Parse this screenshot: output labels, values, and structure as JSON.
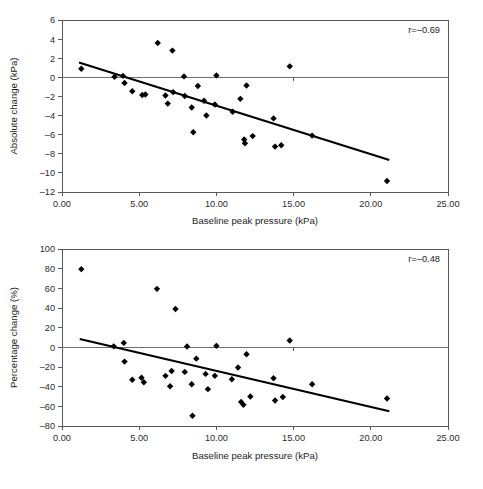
{
  "figure": {
    "background": "#ffffff",
    "marker_color": "#000000",
    "trend_color": "#000000",
    "axis_color": "#55595c"
  },
  "chart_data": [
    {
      "id": "absolute-change",
      "type": "scatter",
      "title": "",
      "xlabel": "Baseline peak pressure (kPa)",
      "ylabel": "Absolute change (kPa)",
      "xlim": [
        0,
        25
      ],
      "ylim": [
        -12,
        6
      ],
      "grid": false,
      "legend": "none",
      "xticks": [
        0,
        5,
        10,
        15,
        20,
        25
      ],
      "xtick_labels": [
        "0.00",
        "5.00",
        "10.00",
        "15.00",
        "20.00",
        "25.00"
      ],
      "yticks": [
        6,
        4,
        2,
        0,
        -2,
        -4,
        -6,
        -8,
        -10,
        -12
      ],
      "ytick_labels": [
        "6",
        "4",
        "2",
        "0",
        "–2",
        "–4",
        "–6",
        "–8",
        "–10",
        "–12"
      ],
      "zero_line": 0,
      "annotation": "r=–0.69",
      "annotation_value": -0.69,
      "trend": {
        "x1": 1.1,
        "y1": 1.55,
        "x2": 21.2,
        "y2": -8.65
      },
      "points": [
        {
          "x": 1.25,
          "y": 0.9
        },
        {
          "x": 3.4,
          "y": 0.05
        },
        {
          "x": 3.95,
          "y": 0.15
        },
        {
          "x": 4.05,
          "y": -0.6
        },
        {
          "x": 4.55,
          "y": -1.45
        },
        {
          "x": 5.2,
          "y": -1.85
        },
        {
          "x": 5.4,
          "y": -1.8
        },
        {
          "x": 6.2,
          "y": 3.6
        },
        {
          "x": 6.7,
          "y": -1.9
        },
        {
          "x": 6.85,
          "y": -2.75
        },
        {
          "x": 7.15,
          "y": 2.8
        },
        {
          "x": 7.2,
          "y": -1.55
        },
        {
          "x": 7.9,
          "y": 0.1
        },
        {
          "x": 7.95,
          "y": -1.95
        },
        {
          "x": 8.4,
          "y": -3.15
        },
        {
          "x": 8.5,
          "y": -5.75
        },
        {
          "x": 8.8,
          "y": -0.9
        },
        {
          "x": 9.2,
          "y": -2.45
        },
        {
          "x": 9.35,
          "y": -4.0
        },
        {
          "x": 9.9,
          "y": -2.85
        },
        {
          "x": 10.0,
          "y": 0.2
        },
        {
          "x": 11.05,
          "y": -3.6
        },
        {
          "x": 11.55,
          "y": -2.25
        },
        {
          "x": 11.8,
          "y": -6.5
        },
        {
          "x": 11.85,
          "y": -6.9
        },
        {
          "x": 11.95,
          "y": -0.85
        },
        {
          "x": 12.35,
          "y": -6.15
        },
        {
          "x": 13.7,
          "y": -4.3
        },
        {
          "x": 13.8,
          "y": -7.25
        },
        {
          "x": 14.2,
          "y": -7.1
        },
        {
          "x": 14.75,
          "y": 1.15
        },
        {
          "x": 16.2,
          "y": -6.1
        },
        {
          "x": 21.05,
          "y": -10.85
        }
      ]
    },
    {
      "id": "percentage-change",
      "type": "scatter",
      "title": "",
      "xlabel": "Baseline peak pressure (kPa)",
      "ylabel": "Percentage change (%)",
      "xlim": [
        0,
        25
      ],
      "ylim": [
        -80,
        100
      ],
      "grid": false,
      "legend": "none",
      "xticks": [
        0,
        5,
        10,
        15,
        20,
        25
      ],
      "xtick_labels": [
        "0.00",
        "5.00",
        "10.00",
        "15.00",
        "20.00",
        "25.00"
      ],
      "yticks": [
        100,
        80,
        60,
        40,
        20,
        0,
        -20,
        -40,
        -60,
        -80
      ],
      "ytick_labels": [
        "100",
        "80",
        "60",
        "40",
        "20",
        "0",
        "–20",
        "–40",
        "–60",
        "–80"
      ],
      "zero_line": 0,
      "annotation": "r=–0.48",
      "annotation_value": -0.48,
      "trend": {
        "x1": 1.15,
        "y1": 8.5,
        "x2": 21.2,
        "y2": -65.0
      },
      "points": [
        {
          "x": 1.25,
          "y": 79.5
        },
        {
          "x": 3.35,
          "y": 1.0
        },
        {
          "x": 4.0,
          "y": 4.5
        },
        {
          "x": 4.05,
          "y": -14.5
        },
        {
          "x": 4.55,
          "y": -33.0
        },
        {
          "x": 5.15,
          "y": -31.0
        },
        {
          "x": 5.3,
          "y": -35.5
        },
        {
          "x": 6.15,
          "y": 59.5
        },
        {
          "x": 6.7,
          "y": -29.0
        },
        {
          "x": 7.0,
          "y": -39.5
        },
        {
          "x": 7.1,
          "y": -24.0
        },
        {
          "x": 7.35,
          "y": 39.0
        },
        {
          "x": 7.95,
          "y": -25.0
        },
        {
          "x": 8.1,
          "y": 0.8
        },
        {
          "x": 8.4,
          "y": -37.5
        },
        {
          "x": 8.45,
          "y": -69.5
        },
        {
          "x": 8.7,
          "y": -11.5
        },
        {
          "x": 9.3,
          "y": -27.0
        },
        {
          "x": 9.45,
          "y": -42.5
        },
        {
          "x": 9.9,
          "y": -29.0
        },
        {
          "x": 10.0,
          "y": 1.5
        },
        {
          "x": 11.0,
          "y": -32.5
        },
        {
          "x": 11.4,
          "y": -20.5
        },
        {
          "x": 11.6,
          "y": -55.5
        },
        {
          "x": 11.75,
          "y": -58.5
        },
        {
          "x": 11.95,
          "y": -7.0
        },
        {
          "x": 12.2,
          "y": -50.0
        },
        {
          "x": 13.7,
          "y": -31.5
        },
        {
          "x": 13.8,
          "y": -54.0
        },
        {
          "x": 14.3,
          "y": -50.5
        },
        {
          "x": 14.75,
          "y": 7.0
        },
        {
          "x": 16.2,
          "y": -37.5
        },
        {
          "x": 21.05,
          "y": -52.0
        }
      ]
    }
  ]
}
